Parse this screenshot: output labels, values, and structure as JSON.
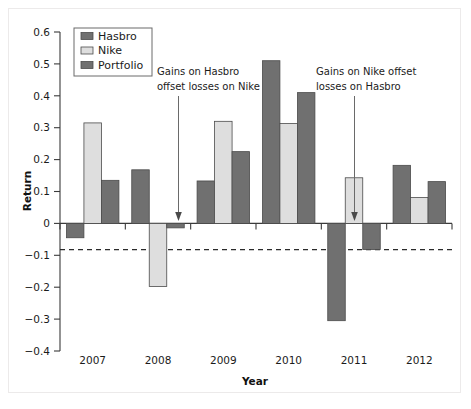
{
  "chart_data": {
    "type": "bar",
    "title": "",
    "xlabel": "Year",
    "ylabel": "Return",
    "categories": [
      "2007",
      "2008",
      "2009",
      "2010",
      "2011",
      "2012"
    ],
    "series": [
      {
        "name": "Hasbro",
        "color": "#707070",
        "values": [
          -0.045,
          0.168,
          0.133,
          0.51,
          -0.305,
          0.182
        ]
      },
      {
        "name": "Nike",
        "color": "#dedede",
        "values": [
          0.315,
          -0.198,
          0.32,
          0.313,
          0.143,
          0.081
        ]
      },
      {
        "name": "Portfolio",
        "color": "#707070",
        "values": [
          0.135,
          -0.014,
          0.225,
          0.41,
          -0.082,
          0.131
        ]
      }
    ],
    "ylim": [
      -0.4,
      0.6
    ],
    "yticks": [
      "0.6",
      "0.5",
      "0.4",
      "0.3",
      "0.2",
      "0.1",
      "0",
      "−0.1",
      "−0.2",
      "−0.3",
      "−0.4"
    ],
    "ytick_values": [
      0.6,
      0.5,
      0.4,
      0.3,
      0.2,
      0.1,
      0,
      -0.1,
      -0.2,
      -0.3,
      -0.4
    ],
    "grid": false,
    "legend_position": "top-left",
    "reference_line": {
      "value": -0.082,
      "style": "dashed"
    },
    "annotations": [
      {
        "id": "left",
        "line1": "Gains on Hasbro",
        "line2": "offset losses on Nike",
        "points_to": "2008 Portfolio"
      },
      {
        "id": "right",
        "line1": "Gains on Nike offset",
        "line2": "losses on Hasbro",
        "points_to": "2011 Portfolio"
      }
    ]
  },
  "legend": {
    "items": [
      {
        "label": "Hasbro"
      },
      {
        "label": "Nike"
      },
      {
        "label": "Portfolio"
      }
    ]
  }
}
